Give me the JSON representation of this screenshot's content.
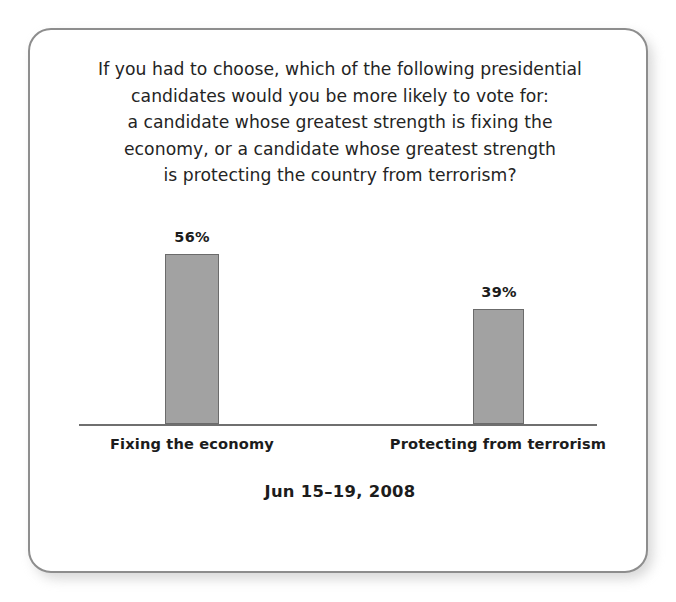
{
  "card": {
    "border_color": "#8d8d8d",
    "background": "#ffffff"
  },
  "question": {
    "lines": [
      "If you had to choose, which of the following presidential",
      "candidates would you be more likely to vote for:",
      "a candidate whose greatest strength is fixing the",
      "economy, or a candidate whose greatest strength",
      "is protecting the country from terrorism?"
    ]
  },
  "caption": {
    "date_range": "Jun 15–19, 2008"
  },
  "chart_data": {
    "type": "bar",
    "subtitle": "Jun 15–19, 2008",
    "categories": [
      "Fixing the economy",
      "Protecting from terrorism"
    ],
    "values": [
      56,
      39
    ],
    "value_labels": [
      "56%",
      "39%"
    ],
    "unit": "%",
    "xlabel": "",
    "ylabel": "",
    "ylim": [
      0,
      100
    ],
    "grid": false,
    "legend": "none",
    "bar_fill_color": "#a2a2a2",
    "bar_border_color": "#6b6b6b",
    "axis_color": "#6f6f6f"
  }
}
